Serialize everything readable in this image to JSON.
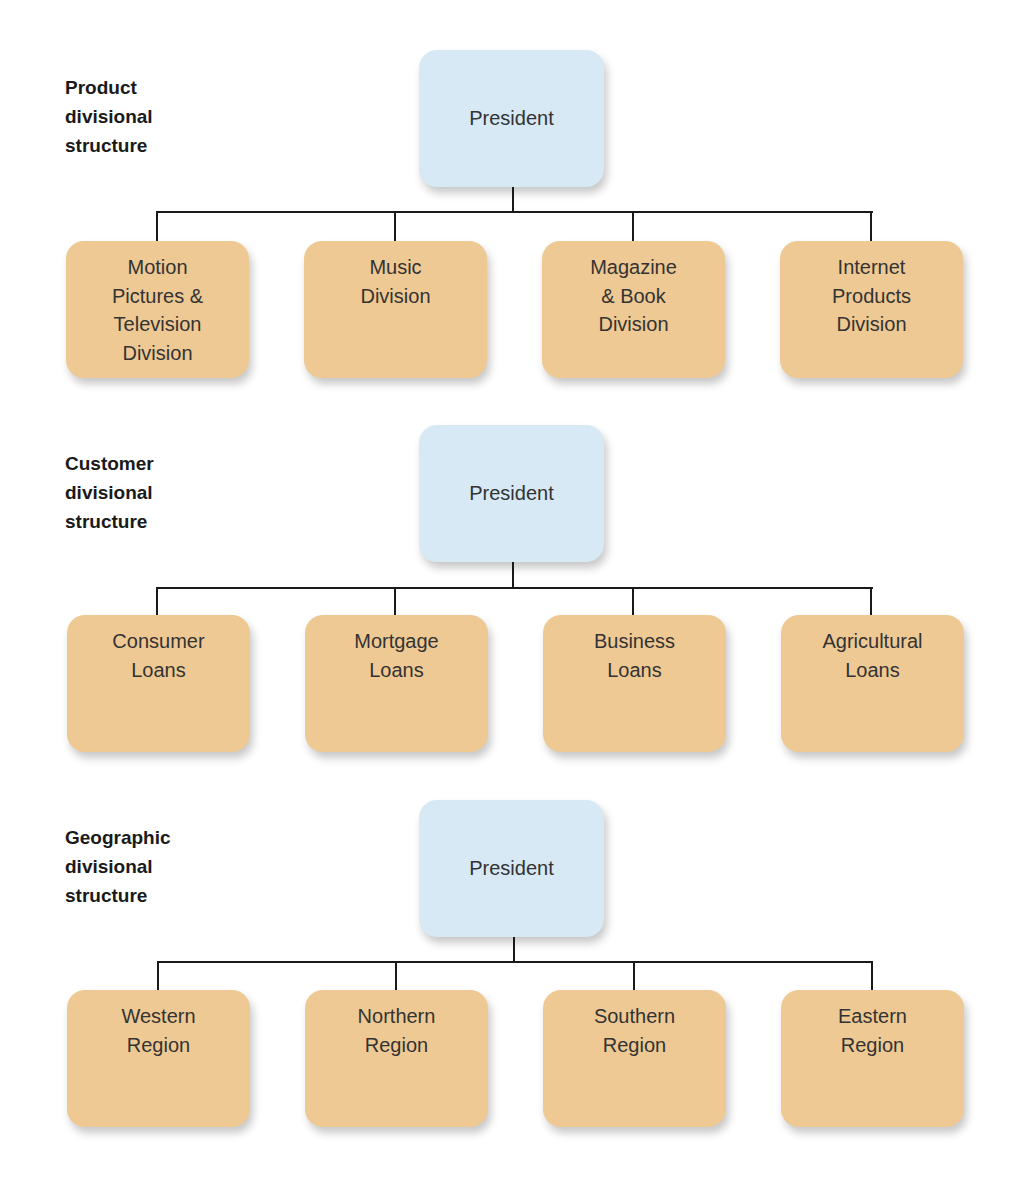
{
  "colors": {
    "president_fill": "#d6e9f5",
    "division_fill": "#efc993",
    "connector": "#1a1a1a",
    "text": "#333333"
  },
  "sections": [
    {
      "label": [
        "Product",
        "divisional",
        "structure"
      ],
      "root": "President",
      "children": [
        [
          "Motion",
          "Pictures &",
          "Television",
          "Division"
        ],
        [
          "Music",
          "Division"
        ],
        [
          "Magazine",
          "& Book",
          "Division"
        ],
        [
          "Internet",
          "Products",
          "Division"
        ]
      ]
    },
    {
      "label": [
        "Customer",
        "divisional",
        "structure"
      ],
      "root": "President",
      "children": [
        [
          "Consumer",
          "Loans"
        ],
        [
          "Mortgage",
          "Loans"
        ],
        [
          "Business",
          "Loans"
        ],
        [
          "Agricultural",
          "Loans"
        ]
      ]
    },
    {
      "label": [
        "Geographic",
        "divisional",
        "structure"
      ],
      "root": "President",
      "children": [
        [
          "Western",
          "Region"
        ],
        [
          "Northern",
          "Region"
        ],
        [
          "Southern",
          "Region"
        ],
        [
          "Eastern",
          "Region"
        ]
      ]
    }
  ]
}
